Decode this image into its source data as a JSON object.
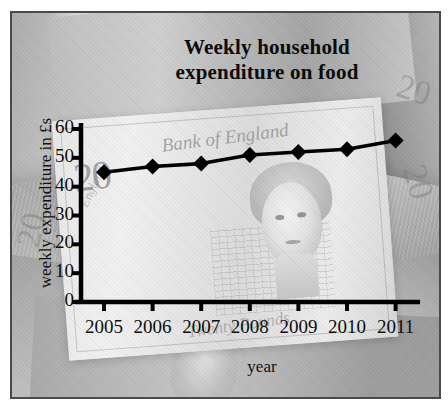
{
  "chart_data": {
    "type": "line",
    "title": "Weekly household expenditure on food",
    "title_line1": "Weekly household",
    "title_line2": "expenditure on food",
    "xlabel": "year",
    "ylabel": "weekly expenditure in £s",
    "categories": [
      "2005",
      "2006",
      "2007",
      "2008",
      "2009",
      "2010",
      "2011"
    ],
    "values": [
      45,
      47,
      48,
      51,
      52,
      53,
      56
    ],
    "series": [
      {
        "name": "weekly household expenditure on food",
        "values": [
          45,
          47,
          48,
          51,
          52,
          53,
          56
        ]
      }
    ],
    "ylim": [
      0,
      60
    ],
    "ytick_labels": [
      "0",
      "10",
      "20",
      "30",
      "40",
      "50",
      "60"
    ],
    "ytick_values": [
      0,
      10,
      20,
      30,
      40,
      50,
      60
    ],
    "grid": false,
    "legend": false,
    "marker": "diamond",
    "line_color": "#000000",
    "marker_color": "#000000",
    "text_color": "#0d0d0d",
    "background": "banknote-collage-grayscale"
  },
  "background_art": {
    "denomination": "20",
    "bank_script": "Bank of England",
    "value_script": "Twenty Pounds",
    "side_script": "England"
  }
}
